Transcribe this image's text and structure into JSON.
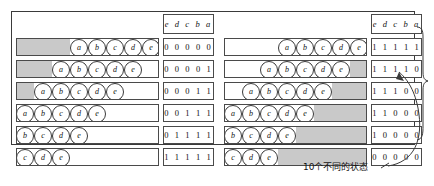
{
  "figure": {
    "caption": "10个不同的状态",
    "header_label": "e d c b a"
  },
  "left_table": {
    "name": "shift-in-register-table",
    "header": "e d c b a",
    "rows": [
      {
        "binary": "0 0 0 0 0",
        "circles": [
          "a",
          "b",
          "c",
          "d",
          "e"
        ],
        "shift": 0
      },
      {
        "binary": "0 0 0 0 1",
        "circles": [
          "a",
          "b",
          "c",
          "d",
          "e"
        ],
        "shift": 1
      },
      {
        "binary": "0 0 0 1 1",
        "circles": [
          "a",
          "b",
          "c",
          "d",
          "e"
        ],
        "shift": 2
      },
      {
        "binary": "0 0 1 1 1",
        "circles": [
          "a",
          "b",
          "c",
          "d",
          "e"
        ],
        "shift": 3
      },
      {
        "binary": "0 1 1 1 1",
        "circles": [
          "a",
          "b",
          "c",
          "d",
          "e"
        ],
        "shift": 4
      },
      {
        "binary": "1 1 1 1 1",
        "circles": [
          "a",
          "b",
          "c",
          "d",
          "e"
        ],
        "shift": 5
      }
    ]
  },
  "right_table": {
    "name": "shift-out-register-table",
    "header": "e d c b a",
    "rows": [
      {
        "binary": "1 1 1 1 1",
        "circles": [
          "a",
          "b",
          "c",
          "d",
          "e"
        ],
        "shift": 0
      },
      {
        "binary": "1 1 1 1 0",
        "circles": [
          "a",
          "b",
          "c",
          "d",
          "e"
        ],
        "shift": 1
      },
      {
        "binary": "1 1 1 0 0",
        "circles": [
          "a",
          "b",
          "c",
          "d",
          "e"
        ],
        "shift": 2
      },
      {
        "binary": "1 1 0 0 0",
        "circles": [
          "a",
          "b",
          "c",
          "d",
          "e"
        ],
        "shift": 3
      },
      {
        "binary": "1 0 0 0 0",
        "circles": [
          "a",
          "b",
          "c",
          "d",
          "e"
        ],
        "shift": 4
      },
      {
        "binary": "0 0 0 0 0",
        "circles": [
          "a",
          "b",
          "c",
          "d",
          "e"
        ],
        "shift": 5
      }
    ]
  },
  "colors": {
    "shade": "#c9c9c9",
    "line": "#4a4a4a",
    "text": "#111111"
  }
}
